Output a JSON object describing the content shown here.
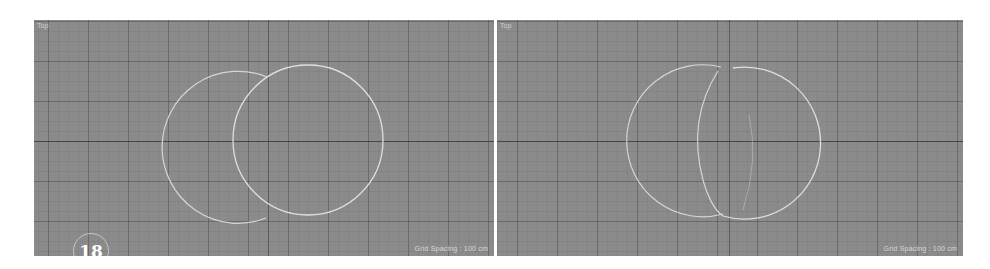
{
  "figure": {
    "step_number": "18",
    "colors": {
      "viewport_bg": "#8b8b8b",
      "grid_line": "#5a5a5a",
      "spline": "#e6e6e6",
      "gap": "#ffffff"
    }
  },
  "viewports": [
    {
      "label": "Top",
      "status": "Grid Spacing : 100 cm",
      "shapes": [
        {
          "name": "circle-left",
          "cx": 189,
          "cy": 119,
          "r": 76
        },
        {
          "name": "circle-right",
          "cx": 274,
          "cy": 120,
          "r": 75
        }
      ]
    },
    {
      "label": "Top",
      "status": "Grid Spacing : 100 cm",
      "shapes": [
        {
          "name": "merged-spline-left",
          "cx": 170,
          "cy": 119,
          "r": 76
        },
        {
          "name": "merged-spline-right",
          "cx": 279,
          "cy": 120,
          "r": 76
        }
      ]
    }
  ]
}
